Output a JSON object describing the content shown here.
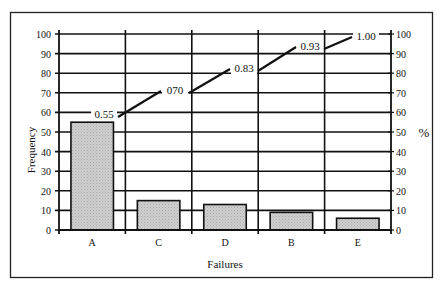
{
  "chart_data": {
    "type": "bar",
    "subtype": "pareto",
    "title": "",
    "xlabel": "Failures",
    "ylabel": "Frequency",
    "y2label": "%",
    "categories": [
      "A",
      "C",
      "D",
      "B",
      "E"
    ],
    "series": [
      {
        "name": "Frequency",
        "type": "bar",
        "axis": "left",
        "values": [
          55,
          15,
          13,
          9,
          6
        ]
      },
      {
        "name": "Cumulative proportion",
        "type": "line",
        "axis": "right",
        "values": [
          0.55,
          0.7,
          0.83,
          0.93,
          1.0
        ],
        "labels": [
          "0.55",
          "070",
          "0.83",
          "0.93",
          "1.00"
        ]
      }
    ],
    "ylim": [
      0,
      100
    ],
    "y2lim": [
      0,
      100
    ],
    "yticks": [
      0,
      10,
      20,
      30,
      40,
      50,
      60,
      70,
      80,
      90,
      100
    ],
    "y2ticks": [
      0,
      10,
      20,
      30,
      40,
      50,
      60,
      70,
      80,
      90,
      100
    ],
    "grid": true,
    "legend": "none",
    "colors": {
      "bar_fill": "#c8c8c8",
      "bar_edge": "#111111",
      "line": "#111111",
      "grid": "#111111"
    }
  }
}
